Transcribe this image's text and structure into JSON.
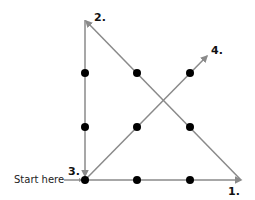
{
  "diagram": {
    "line_color": "#8a8a8a",
    "dot_color": "#000000",
    "dots": [
      {
        "x": 85,
        "y": 73
      },
      {
        "x": 137,
        "y": 73
      },
      {
        "x": 190,
        "y": 73
      },
      {
        "x": 85,
        "y": 127
      },
      {
        "x": 137,
        "y": 127
      },
      {
        "x": 190,
        "y": 127
      },
      {
        "x": 85,
        "y": 180
      },
      {
        "x": 137,
        "y": 180
      },
      {
        "x": 190,
        "y": 180
      }
    ],
    "segments": [
      {
        "label": "1.",
        "from": {
          "x": 85,
          "y": 180
        },
        "to": {
          "x": 241,
          "y": 180
        }
      },
      {
        "label": "2.",
        "from": {
          "x": 241,
          "y": 180
        },
        "to": {
          "x": 85,
          "y": 22
        }
      },
      {
        "label": "3.",
        "from": {
          "x": 85,
          "y": 22
        },
        "to": {
          "x": 85,
          "y": 177
        }
      },
      {
        "label": "4.",
        "from": {
          "x": 85,
          "y": 180
        },
        "to": {
          "x": 207,
          "y": 56
        }
      }
    ],
    "labels": {
      "step1": "1.",
      "step2": "2.",
      "step3": "3.",
      "step4": "4.",
      "start": "Start here"
    }
  }
}
